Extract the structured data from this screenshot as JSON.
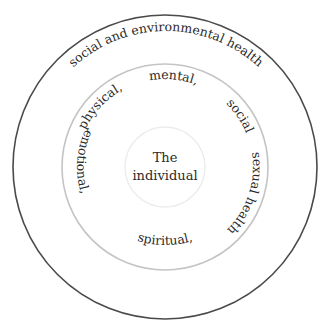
{
  "diagram": {
    "outer_ring": {
      "label": "social and environmental health",
      "stroke": "#4a4a4a"
    },
    "middle_ring": {
      "stroke": "#c4c4c4",
      "labels": {
        "physical": "physical,",
        "mental": "mental,",
        "social": "social",
        "emotional": "emotional,",
        "spiritual": "spiritual,",
        "sexual": "sexual health"
      }
    },
    "inner_circle": {
      "line1": "The",
      "line2": "individual",
      "stroke": "#ececec"
    }
  }
}
